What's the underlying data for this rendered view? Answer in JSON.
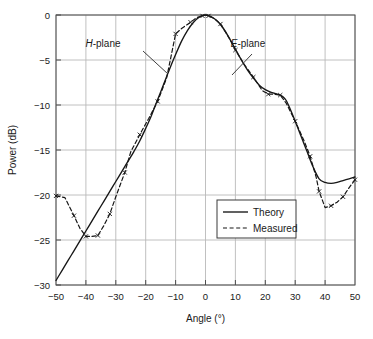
{
  "chart_data": {
    "type": "line",
    "title": "",
    "xlabel": "Angle (°)",
    "ylabel": "Power (dB)",
    "xlim": [
      -50,
      50
    ],
    "ylim": [
      -30,
      0
    ],
    "xticks": [
      -50,
      -40,
      -30,
      -20,
      -10,
      0,
      10,
      20,
      30,
      40,
      50
    ],
    "xtick_labels": [
      "−50",
      "−40",
      "−30",
      "−20",
      "−10",
      "0",
      "10",
      "20",
      "30",
      "40",
      "50"
    ],
    "yticks": [
      0,
      -5,
      -10,
      -15,
      -20,
      -25,
      -30
    ],
    "ytick_labels": [
      "0",
      "−5",
      "−10",
      "−15",
      "−20",
      "−25",
      "−30"
    ],
    "grid": true,
    "legend_position": "center-right-lower",
    "series": [
      {
        "name": "Theory",
        "style": "solid",
        "markers": false,
        "x": [
          -50,
          -48,
          -46,
          -44,
          -42,
          -40,
          -38,
          -36,
          -34,
          -32,
          -30,
          -28,
          -26,
          -24,
          -22,
          -20,
          -18,
          -16,
          -14,
          -12,
          -10,
          -8,
          -6,
          -4,
          -2,
          0,
          2,
          4,
          6,
          8,
          10,
          12,
          14,
          16,
          18,
          20,
          22,
          24,
          25,
          26,
          27,
          28,
          30,
          32,
          34,
          36,
          38,
          40,
          42,
          44,
          46,
          48,
          50
        ],
        "y": [
          -29.5,
          -28.4,
          -27.3,
          -26.2,
          -25.1,
          -24.0,
          -22.9,
          -21.8,
          -20.7,
          -19.6,
          -18.5,
          -17.4,
          -16.3,
          -15.2,
          -14.0,
          -12.6,
          -11.1,
          -9.4,
          -7.7,
          -6.0,
          -4.4,
          -2.9,
          -1.7,
          -0.8,
          -0.2,
          0.0,
          -0.2,
          -0.7,
          -1.5,
          -2.6,
          -3.8,
          -5.0,
          -6.1,
          -7.0,
          -7.8,
          -8.3,
          -8.6,
          -8.8,
          -8.9,
          -9.1,
          -9.5,
          -10.2,
          -11.8,
          -13.5,
          -15.2,
          -16.9,
          -18.2,
          -18.6,
          -18.7,
          -18.6,
          -18.4,
          -18.2,
          -18.0
        ]
      },
      {
        "name": "Measured",
        "style": "dashed",
        "markers": true,
        "marker_shape": "x",
        "x": [
          -50,
          -47,
          -44,
          -42,
          -40,
          -38,
          -36,
          -34,
          -32,
          -30,
          -27,
          -25,
          -22,
          -19,
          -16,
          -13,
          -10,
          -8,
          -5,
          -3,
          -1,
          0,
          1,
          3,
          5,
          8,
          10,
          13,
          16,
          19,
          21,
          23,
          25,
          27,
          30,
          33,
          35,
          37,
          38,
          40,
          42,
          44,
          46,
          48,
          50
        ],
        "y": [
          -20.1,
          -20.3,
          -22.3,
          -23.7,
          -24.6,
          -24.6,
          -24.5,
          -23.4,
          -22.1,
          -20.2,
          -17.5,
          -15.2,
          -13.3,
          -11.5,
          -9.6,
          -7.0,
          -2.1,
          -1.5,
          -0.8,
          -0.3,
          -0.1,
          0.0,
          -0.1,
          -0.4,
          -1.0,
          -2.6,
          -3.9,
          -5.5,
          -6.9,
          -8.4,
          -8.8,
          -8.8,
          -8.9,
          -9.8,
          -11.8,
          -14.0,
          -15.7,
          -18.0,
          -19.6,
          -21.4,
          -21.2,
          -20.8,
          -20.2,
          -19.2,
          -18.3
        ]
      }
    ],
    "annotations": [
      {
        "name": "h-plane-label",
        "text_italic": "H",
        "text_rest": "-plane",
        "x_px": 103,
        "y_px": 47,
        "leader_from": [
          143,
          51
        ],
        "leader_to": [
          168,
          74
        ]
      },
      {
        "name": "e-plane-label",
        "text_italic": "E",
        "text_rest": "-plane",
        "x_px": 248,
        "y_px": 47,
        "leader_from": [
          252,
          54
        ],
        "leader_to": [
          232,
          75
        ]
      }
    ]
  },
  "legend": {
    "entries": [
      {
        "label": "Theory",
        "style": "solid"
      },
      {
        "label": "Measured",
        "style": "dashed"
      }
    ]
  }
}
